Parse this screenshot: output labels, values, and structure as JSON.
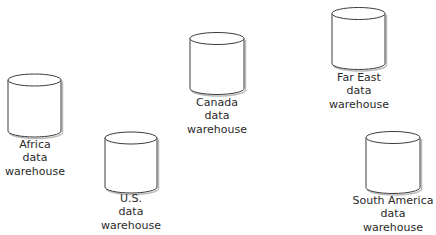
{
  "diagram": {
    "type": "data-warehouse-nodes",
    "nodes": [
      {
        "id": "africa",
        "shape": "cylinder",
        "lines": [
          "Africa",
          "data",
          "warehouse"
        ]
      },
      {
        "id": "us",
        "shape": "cylinder",
        "lines": [
          "U.S.",
          "data",
          "warehouse"
        ]
      },
      {
        "id": "canada",
        "shape": "cylinder",
        "lines": [
          "Canada",
          "data",
          "warehouse"
        ]
      },
      {
        "id": "far-east",
        "shape": "cylinder",
        "lines": [
          "Far East",
          "data",
          "warehouse"
        ]
      },
      {
        "id": "south-america",
        "shape": "cylinder",
        "lines": [
          "South America",
          "data",
          "warehouse"
        ]
      }
    ],
    "colors": {
      "stroke": "#3a3a3a",
      "fill": "#ffffff",
      "text": "#2a2a2a"
    }
  }
}
